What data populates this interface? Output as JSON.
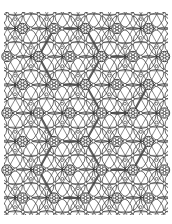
{
  "figure": {
    "title": "Periodic rosette lattice pattern with highlighted hexagonal cells",
    "background": "#ffffff",
    "ink_color": "#2a2a2a"
  },
  "lattice": {
    "type": "triangular",
    "dx": 31.4,
    "dy": 28.2,
    "x0": 7.5,
    "y0": 28.5,
    "clip": {
      "x": 4,
      "y": 12,
      "w": 164,
      "h": 203
    },
    "rows": [
      {
        "y": 28.5,
        "xs": [
          22.5,
          54,
          85.5,
          117,
          148.5
        ]
      },
      {
        "y": 56.5,
        "xs": [
          7,
          38.5,
          70,
          101.5,
          133,
          164.5
        ]
      },
      {
        "y": 84.5,
        "xs": [
          22.5,
          54,
          85.5,
          117,
          148.5
        ]
      },
      {
        "y": 113,
        "xs": [
          7,
          38.5,
          70,
          101.5,
          133,
          164.5
        ]
      },
      {
        "y": 141.5,
        "xs": [
          22.5,
          54,
          85.5,
          117,
          148.5
        ]
      },
      {
        "y": 170,
        "xs": [
          7,
          38.5,
          70,
          101.5,
          133,
          164.5
        ]
      },
      {
        "y": 198,
        "xs": [
          22.5,
          54,
          85.5,
          117,
          148.5
        ]
      }
    ],
    "rosette": {
      "ring_radius": 5.2,
      "dot_count": 6,
      "dot_radius": 1.5,
      "dot_orbit": 3.0
    },
    "petal_radius": 15.5,
    "mini_circle_radius": 1.6
  },
  "highlight_paths": [
    [
      [
        54,
        28.5
      ],
      [
        85.5,
        28.5
      ],
      [
        101.5,
        56.5
      ],
      [
        85.5,
        84.5
      ],
      [
        54,
        84.5
      ],
      [
        38.5,
        56.5
      ],
      [
        54,
        28.5
      ]
    ],
    [
      [
        101.5,
        56.5
      ],
      [
        133,
        56.5
      ]
    ],
    [
      [
        85.5,
        84.5
      ],
      [
        101.5,
        113
      ],
      [
        133,
        113
      ],
      [
        148.5,
        84.5
      ]
    ],
    [
      [
        38.5,
        113
      ],
      [
        54,
        141.5
      ],
      [
        85.5,
        141.5
      ],
      [
        101.5,
        113
      ]
    ],
    [
      [
        85.5,
        141.5
      ],
      [
        101.5,
        170
      ],
      [
        133,
        170
      ],
      [
        148.5,
        141.5
      ]
    ],
    [
      [
        54,
        141.5
      ],
      [
        38.5,
        170
      ],
      [
        54,
        198
      ],
      [
        85.5,
        198
      ],
      [
        101.5,
        170
      ]
    ]
  ]
}
